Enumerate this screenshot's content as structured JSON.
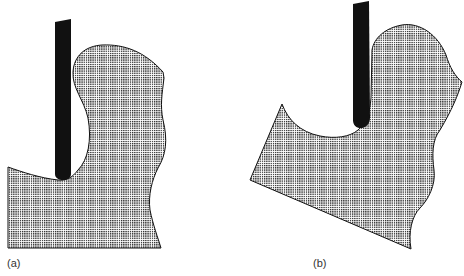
{
  "figure": {
    "panels": [
      {
        "id": "a",
        "label": "(a)",
        "description": "Vertical tool engaged in workpiece cavity, workpiece level"
      },
      {
        "id": "b",
        "label": "(b)",
        "description": "Vertical tool engaged in workpiece cavity, workpiece tilted"
      }
    ],
    "colors": {
      "background": "#ffffff",
      "tool": "#111111",
      "workpiece_dot": "#222222",
      "workpiece_bg": "#ffffff",
      "outline": "#111111",
      "label": "#333333"
    }
  }
}
